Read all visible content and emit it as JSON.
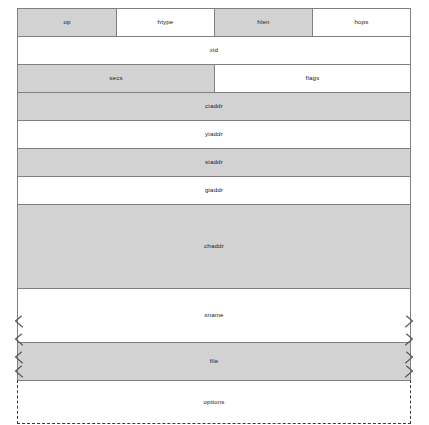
{
  "diagram": {
    "colors": {
      "field_fill_shaded": "#d2d2d2",
      "field_fill_plain": "#ffffff",
      "border": "#808080",
      "dashed_border": "#3a3a3a",
      "text": "#1a1a1a",
      "background": "#ffffff"
    },
    "rows": [
      {
        "name": "row-op-htype-hlen-hops",
        "fields": [
          {
            "label": "op",
            "fill": "shaded"
          },
          {
            "label": "htype",
            "fill": "plain"
          },
          {
            "label": "hlen",
            "fill": "shaded"
          },
          {
            "label": "hops",
            "fill": "plain"
          }
        ]
      },
      {
        "name": "row-xid",
        "fields": [
          {
            "label": "xid",
            "fill": "plain"
          }
        ]
      },
      {
        "name": "row-secs-flags",
        "fields": [
          {
            "label": "secs",
            "fill": "shaded"
          },
          {
            "label": "flags",
            "fill": "plain"
          }
        ]
      },
      {
        "name": "row-ciaddr",
        "fields": [
          {
            "label": "ciaddr",
            "fill": "shaded"
          }
        ]
      },
      {
        "name": "row-yiaddr",
        "fields": [
          {
            "label": "yiaddr",
            "fill": "plain"
          }
        ]
      },
      {
        "name": "row-siaddr",
        "fields": [
          {
            "label": "siaddr",
            "fill": "shaded"
          }
        ]
      },
      {
        "name": "row-giaddr",
        "fields": [
          {
            "label": "giaddr",
            "fill": "plain"
          }
        ]
      },
      {
        "name": "row-chaddr",
        "fields": [
          {
            "label": "chaddr",
            "fill": "shaded"
          }
        ]
      },
      {
        "name": "row-sname",
        "fields": [
          {
            "label": "sname",
            "fill": "plain"
          }
        ]
      },
      {
        "name": "row-file",
        "fields": [
          {
            "label": "file",
            "fill": "shaded"
          }
        ]
      },
      {
        "name": "row-options",
        "fields": [
          {
            "label": "options",
            "fill": "plain"
          }
        ]
      }
    ]
  }
}
